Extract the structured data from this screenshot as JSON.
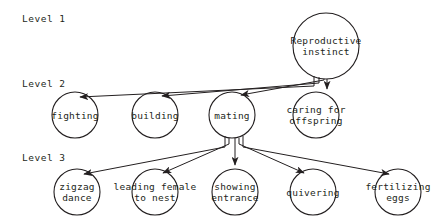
{
  "diagram": {
    "stroke_color": "#231f20",
    "background_color": "#ffffff",
    "levels": [
      {
        "id": "level-1",
        "label": "Level 1",
        "x": 22,
        "y": 18
      },
      {
        "id": "level-2",
        "label": "Level 2",
        "x": 22,
        "y": 83
      },
      {
        "id": "level-3",
        "label": "Level 3",
        "x": 22,
        "y": 157
      }
    ],
    "nodes": [
      {
        "id": "reproductive-instinct",
        "level": 1,
        "label": "Reproductive\ninstinct",
        "cx": 326,
        "cy": 46,
        "r": 33
      },
      {
        "id": "fighting",
        "level": 2,
        "label": "fighting",
        "cx": 75,
        "cy": 115,
        "r": 23
      },
      {
        "id": "building",
        "level": 2,
        "label": "building",
        "cx": 155,
        "cy": 115,
        "r": 23
      },
      {
        "id": "mating",
        "level": 2,
        "label": "mating",
        "cx": 232,
        "cy": 115,
        "r": 23
      },
      {
        "id": "caring-for-offspring",
        "level": 2,
        "label": "caring for\noffspring",
        "cx": 316,
        "cy": 115,
        "r": 23
      },
      {
        "id": "zigzag-dance",
        "level": 3,
        "label": "zigzag\ndance",
        "cx": 77,
        "cy": 192,
        "r": 23
      },
      {
        "id": "leading-female-to-nest",
        "level": 3,
        "label": "leading female\nto nest",
        "cx": 155,
        "cy": 192,
        "r": 23
      },
      {
        "id": "showing-entrance",
        "level": 3,
        "label": "showing\nentrance",
        "cx": 235,
        "cy": 192,
        "r": 23
      },
      {
        "id": "quivering",
        "level": 3,
        "label": "quivering",
        "cx": 313,
        "cy": 192,
        "r": 23
      },
      {
        "id": "fertilizing-eggs",
        "level": 3,
        "label": "fertilizing\neggs",
        "cx": 398,
        "cy": 192,
        "r": 23
      }
    ],
    "edges": [
      {
        "id": "edge-instinct-fighting",
        "from": "reproductive-instinct",
        "to": "fighting"
      },
      {
        "id": "edge-instinct-building",
        "from": "reproductive-instinct",
        "to": "building"
      },
      {
        "id": "edge-instinct-mating",
        "from": "reproductive-instinct",
        "to": "mating"
      },
      {
        "id": "edge-instinct-caring",
        "from": "reproductive-instinct",
        "to": "caring-for-offspring"
      },
      {
        "id": "edge-mating-zigzag",
        "from": "mating",
        "to": "zigzag-dance"
      },
      {
        "id": "edge-mating-leading",
        "from": "mating",
        "to": "leading-female-to-nest"
      },
      {
        "id": "edge-mating-showing",
        "from": "mating",
        "to": "showing-entrance"
      },
      {
        "id": "edge-mating-quivering",
        "from": "mating",
        "to": "quivering"
      },
      {
        "id": "edge-mating-fertilizing",
        "from": "mating",
        "to": "fertilizing-eggs"
      }
    ]
  }
}
